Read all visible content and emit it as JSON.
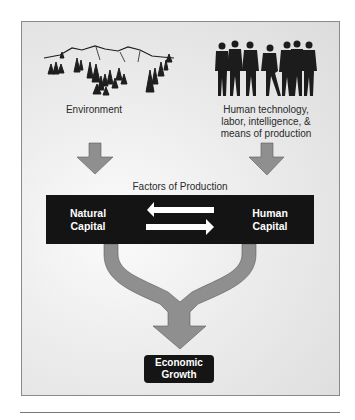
{
  "diagram": {
    "sources": [
      {
        "id": "environment",
        "label": "Environment",
        "icon": "mountain-landscape-icon"
      },
      {
        "id": "human",
        "label_lines": [
          "Human technology,",
          "labor, intelligence, &",
          "means of production"
        ],
        "icon": "people-silhouettes-icon"
      }
    ],
    "section_title": "Factors of Production",
    "factors": {
      "left": {
        "line1": "Natural",
        "line2": "Capital"
      },
      "right": {
        "line1": "Human",
        "line2": "Capital"
      }
    },
    "outcome": {
      "line1": "Economic",
      "line2": "Growth"
    },
    "colors": {
      "arrow_fill": "#8f8f8f",
      "bar": "#141414",
      "background": "#e8e8e8"
    }
  }
}
